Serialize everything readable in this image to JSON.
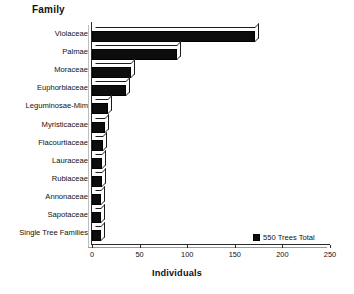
{
  "chart_data": {
    "type": "bar",
    "orientation": "horizontal",
    "title": "Family",
    "xlabel": "Individuals",
    "ylabel": "Family",
    "xlim": [
      0,
      250
    ],
    "xticks": [
      0,
      50,
      100,
      150,
      200,
      250
    ],
    "grid": false,
    "legend_position": "bottom-right",
    "legend": [
      "550 Trees Total"
    ],
    "categories": [
      "Violaceae",
      "Palmae",
      "Moraceae",
      "Euphorbiaceae",
      "Leguminosae-Mim",
      "Myristicaceae",
      "Flacourtiaceae",
      "Lauraceae",
      "Rubiaceae",
      "Annonaceae",
      "Sapotaceae",
      "Single Tree Families"
    ],
    "values": [
      171,
      89,
      41,
      36,
      17,
      14,
      12,
      11,
      10,
      9,
      9,
      9
    ],
    "series": [
      {
        "name": "550 Trees Total",
        "values": [
          171,
          89,
          41,
          36,
          17,
          14,
          12,
          11,
          10,
          9,
          9,
          9
        ],
        "color": "#0d0d0d"
      }
    ]
  },
  "colors": {
    "bar_fill": "#0d0d0d",
    "bar_face_light": "#fdfdfd",
    "axis": "#2a2a2a",
    "text": "#111111",
    "background": "#ffffff"
  },
  "legend": {
    "label": "550 Trees Total",
    "swatch": "legend-swatch-icon"
  }
}
